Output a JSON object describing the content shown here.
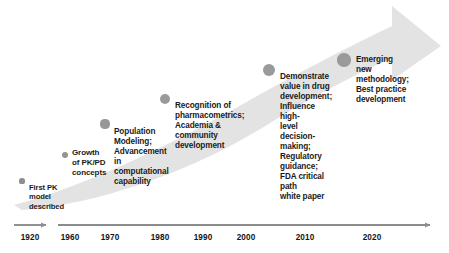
{
  "diagram": {
    "arrow": {
      "name": "growth-arrow",
      "fill_color": "#e3e3e3",
      "direction": "lower-left to upper-right"
    },
    "milestones": [
      {
        "id": "first-pk-model",
        "text": "First PK\nmodel\ndescribed",
        "dot": {
          "cx": 22,
          "cy": 181,
          "r": 2.6,
          "color": "#8f8f8f"
        },
        "label": {
          "x": 29,
          "y": 183,
          "font_size": 7.6
        }
      },
      {
        "id": "pkpd-concepts",
        "text": "Growth\nof PK/PD\nconcepts",
        "dot": {
          "cx": 65,
          "cy": 155,
          "r": 3.4,
          "color": "#949494"
        },
        "label": {
          "x": 72,
          "y": 148,
          "font_size": 8.0
        }
      },
      {
        "id": "population-modeling",
        "text": "Population\nModeling;\nAdvancement in\ncomputational\ncapability",
        "dot": {
          "cx": 105,
          "cy": 124,
          "r": 4.6,
          "color": "#979797"
        },
        "label": {
          "x": 114,
          "y": 127,
          "font_size": 8.2
        }
      },
      {
        "id": "pharmacometrics-recognition",
        "text": "Recognition of\npharmacometrics;\nAcademia &\ncommunity\ndevelopment",
        "dot": {
          "cx": 165,
          "cy": 99,
          "r": 5.4,
          "color": "#9a9a9a"
        },
        "label": {
          "x": 175,
          "y": 101,
          "font_size": 8.2
        }
      },
      {
        "id": "drug-development-value",
        "text": "Demonstrate\nvalue in drug\ndevelopment;\nInfluence high-\nlevel decision-\nmaking;\nRegulatory\nguidance;\nFDA critical path\nwhite paper",
        "dot": {
          "cx": 269,
          "cy": 70,
          "r": 6.2,
          "color": "#9a9a9a"
        },
        "label": {
          "x": 280,
          "y": 72,
          "font_size": 8.2
        }
      },
      {
        "id": "emerging-methodology",
        "text": "Emerging new\nmethodology;\nBest practice\ndevelopment",
        "dot": {
          "cx": 344,
          "cy": 60,
          "r": 6.6,
          "color": "#9a9a9a"
        },
        "label": {
          "x": 356,
          "y": 55,
          "font_size": 8.2
        }
      }
    ],
    "axis": {
      "name": "decade-timeline",
      "line_color": "#8c8c8c",
      "y": 225,
      "segments": [
        {
          "id": "segment-early",
          "x1": 14,
          "x2": 48
        },
        {
          "id": "segment-main",
          "x1": 58,
          "x2": 432
        }
      ],
      "ticks": [
        {
          "label": "1920",
          "x": 30
        },
        {
          "label": "1960",
          "x": 70
        },
        {
          "label": "1970",
          "x": 110
        },
        {
          "label": "1980",
          "x": 160
        },
        {
          "label": "1990",
          "x": 203
        },
        {
          "label": "2000",
          "x": 246
        },
        {
          "label": "2010",
          "x": 305
        },
        {
          "label": "2020",
          "x": 372
        }
      ]
    }
  }
}
